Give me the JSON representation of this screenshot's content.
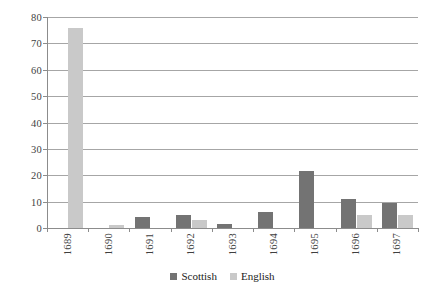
{
  "chart_data": {
    "type": "bar",
    "title": "",
    "subtitle": "",
    "xlabel": "",
    "ylabel": "",
    "categories": [
      "1689",
      "1690",
      "1691",
      "1692",
      "1693",
      "1694",
      "1695",
      "1696",
      "1697"
    ],
    "series": [
      {
        "name": "Scottish",
        "color": "#737373",
        "values": [
          0,
          0,
          4,
          5,
          1.5,
          6,
          21.5,
          11,
          9.5
        ]
      },
      {
        "name": "English",
        "color": "#c9c9c9",
        "values": [
          76,
          1,
          0,
          3,
          0,
          0,
          0,
          5,
          5
        ]
      }
    ],
    "ylim": [
      0,
      80
    ],
    "ytick_values": [
      0,
      10,
      20,
      30,
      40,
      50,
      60,
      70,
      80
    ],
    "ytick_labels": [
      "0",
      "10",
      "20",
      "30",
      "40",
      "50",
      "60",
      "70",
      "80"
    ],
    "grid": "horizontal",
    "legend_position": "bottom-center",
    "xtick_rotation": 90,
    "background": "#ffffff",
    "gridline_color": "#a6a6a6",
    "axis_color": "#8c8c8c"
  }
}
